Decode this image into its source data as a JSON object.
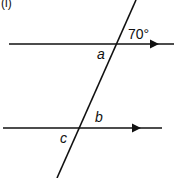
{
  "diagram": {
    "part_label": "(i)",
    "angle_given": "70°",
    "angle_labels": [
      "a",
      "b",
      "c"
    ]
  }
}
